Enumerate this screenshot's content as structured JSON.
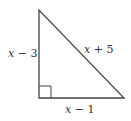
{
  "diagram": {
    "type": "right-triangle",
    "stroke_color": "#444444",
    "vertices": {
      "top": [
        39,
        10
      ],
      "bottom_left": [
        39,
        98
      ],
      "bottom_right": [
        124,
        98
      ]
    },
    "right_angle_marker": {
      "corner": "bottom_left",
      "size": 12
    },
    "labels": {
      "left_leg": {
        "var": "x",
        "op": "−",
        "num": "3"
      },
      "hypotenuse": {
        "var": "x",
        "op": "+",
        "num": "5"
      },
      "bottom_leg": {
        "var": "x",
        "op": "−",
        "num": "1"
      }
    }
  }
}
